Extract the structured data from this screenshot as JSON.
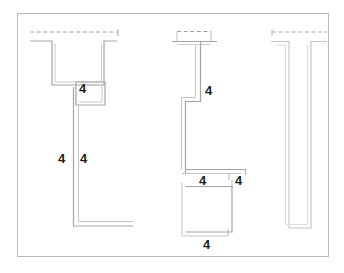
{
  "drawing": {
    "title": "Weld detail — three structural profiles",
    "description": "Technical engineering drawing: three steel section profiles in section view with fillet weld size annotations.",
    "frame": {
      "stroke": "#b9b9b9",
      "fill": "#ffffff",
      "x": 17,
      "y": 13,
      "width": 312,
      "height": 244
    },
    "colors": {
      "line_dark": "#9b9b9b",
      "line_mid": "#ababab",
      "line_light": "#d2d2d2",
      "frame": "#b9b9b9",
      "text": "#1c1c1c",
      "background": "#ffffff"
    },
    "line_width": 1.1,
    "dash_pattern": "4,2.6"
  },
  "profiles": [
    {
      "id": "profile-left",
      "name": "left-channel-profile",
      "label": "Left channel section",
      "weld_annotations": [
        "4",
        "4",
        "4"
      ]
    },
    {
      "id": "profile-middle",
      "name": "middle-tee-profile",
      "label": "Middle tee section",
      "weld_annotations": [
        "4",
        "4",
        "4",
        "4"
      ]
    },
    {
      "id": "profile-right",
      "name": "right-tee-profile",
      "label": "Right tee section",
      "weld_annotations": []
    }
  ],
  "weld_labels": [
    {
      "id": "w1",
      "name": "weld-size-label-left-top",
      "value": "4",
      "x": 84,
      "y": 88
    },
    {
      "id": "w2",
      "name": "weld-size-label-left-a",
      "value": "4",
      "x": 62,
      "y": 158
    },
    {
      "id": "w3",
      "name": "weld-size-label-left-b",
      "value": "4",
      "x": 84,
      "y": 158
    },
    {
      "id": "w4",
      "name": "weld-size-label-mid-top",
      "value": "4",
      "x": 207,
      "y": 91
    },
    {
      "id": "w5",
      "name": "weld-size-label-mid-inner",
      "value": "4",
      "x": 202,
      "y": 180
    },
    {
      "id": "w6",
      "name": "weld-size-label-mid-outer",
      "value": "4",
      "x": 235,
      "y": 180
    },
    {
      "id": "w7",
      "name": "weld-size-label-mid-bottom",
      "value": "4",
      "x": 205,
      "y": 243
    }
  ],
  "geometry": {
    "left_profile": {
      "dashed_top": "M 30 32 L 118 32",
      "dashed_tick": "M 118 30 L 118 36",
      "outer": "M 30 41 L 52 41 L 52 85 L 104 85 L 104 41 L 117 41",
      "inner_u": "M 55 43 L 55 82 L 101 82 L 101 43",
      "box_outer": "M 76 82 L 104 82 L 104 104 L 76 104 Z",
      "box_inner": "M 78 84 L 102 84 L 102 102 L 78 102 Z",
      "stem_outer": "M 74 87 L 74 226 L 133 226",
      "stem_inner": "M 78 104 L 78 222 L 133 222"
    },
    "middle_profile": {
      "dashed_top": "M 176 31 L 211 31",
      "dashed_box": "M 176 31 L 176 40 L 211 40 L 211 31",
      "cap": "M 172 41 L 216 41",
      "stem_right": "M 201 43 L 201 102 L 186 102 L 186 174",
      "stem_left": "M 196 43 L 196 98 L 182 98 L 182 170",
      "inner_shelf": "M 186 170 L 245 170",
      "inner_shelf2": "M 182 174 L 241 174",
      "lower_outer": "M 186 186 L 232 186 L 232 230 L 186 230 Z",
      "lower_inner": "M 190 189 L 228 189 L 228 227 L 190 227"
    },
    "right_profile": {
      "dashed_top": "M 271 32 L 327 32",
      "outer": "M 271 41 L 288 41 L 288 227 L 310 227 L 310 41 L 326 41",
      "inner": "M 275 44 L 285 44 L 285 224 L 307 224 L 307 44"
    }
  }
}
